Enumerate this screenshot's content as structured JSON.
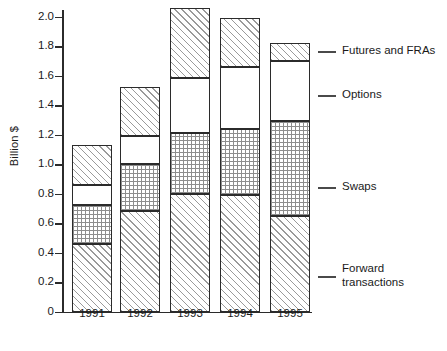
{
  "chart_data": {
    "type": "bar",
    "subtype": "stacked-vertical",
    "title": "",
    "xlabel": "",
    "ylabel": "Billion $",
    "categories": [
      "1991",
      "1992",
      "1993",
      "1994",
      "1995"
    ],
    "ylim": [
      0,
      2.1
    ],
    "yticks": [
      0,
      0.2,
      0.4,
      0.6,
      0.8,
      1.0,
      1.2,
      1.4,
      1.6,
      1.8,
      2.0
    ],
    "ytick_labels": [
      "0",
      "0.2",
      "0.4",
      "0.6",
      "0.8",
      "1.0",
      "1.2",
      "1.4",
      "1.6",
      "1.8",
      "2.0"
    ],
    "grid": false,
    "legend_position": "right",
    "stack_order_bottom_to_top": [
      "Forward transactions",
      "Swaps",
      "Options",
      "Futures and FRAs"
    ],
    "series": [
      {
        "name": "Forward transactions",
        "pattern": "diagonal-hatch",
        "values": [
          0.455,
          0.68,
          0.8,
          0.79,
          0.645
        ]
      },
      {
        "name": "Swaps",
        "pattern": "dot-grid",
        "values": [
          0.27,
          0.32,
          0.41,
          0.445,
          0.645
        ]
      },
      {
        "name": "Options",
        "pattern": "blank",
        "values": [
          0.13,
          0.19,
          0.375,
          0.425,
          0.41
        ]
      },
      {
        "name": "Futures and FRAs",
        "pattern": "diagonal-hatch",
        "values": [
          0.275,
          0.33,
          0.475,
          0.33,
          0.12
        ]
      }
    ],
    "cumulative_tops": {
      "1991": [
        0.455,
        0.725,
        0.855,
        1.13
      ],
      "1992": [
        0.68,
        1.0,
        1.19,
        1.52
      ],
      "1993": [
        0.8,
        1.21,
        1.585,
        2.06
      ],
      "1994": [
        0.79,
        1.235,
        1.66,
        1.99
      ],
      "1995": [
        0.645,
        1.29,
        1.7,
        1.82
      ]
    },
    "totals": [
      1.13,
      1.52,
      2.06,
      1.99,
      1.82
    ]
  },
  "legend": {
    "items": [
      {
        "label": "Futures and FRAs",
        "label_line1": "Futures and FRAs",
        "label_line2": ""
      },
      {
        "label": "Options",
        "label_line1": "Options",
        "label_line2": ""
      },
      {
        "label": "Swaps",
        "label_line1": "Swaps",
        "label_line2": ""
      },
      {
        "label": "Forward transactions",
        "label_line1": "Forward",
        "label_line2": "transactions"
      }
    ]
  },
  "colors": {
    "axis": "#2b2b2b",
    "bar_outline": "#2b2b2b",
    "hatch": "#9a9a9a",
    "dots": "#8d8d8d",
    "background": "#ffffff",
    "legend_rule": "#4a4a4a"
  }
}
